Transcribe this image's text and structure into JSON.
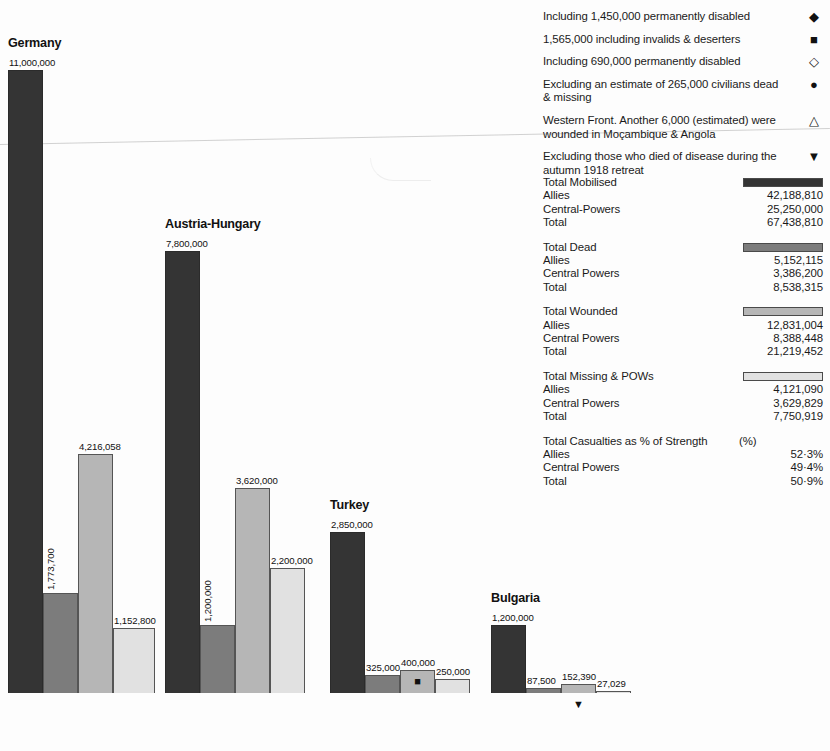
{
  "notes": [
    {
      "text": "Including 1,450,000 permanently disabled",
      "marker": "◆",
      "marker_name": "filled-diamond-icon"
    },
    {
      "text": "1,565,000 including invalids & deserters",
      "marker": "■",
      "marker_name": "filled-square-icon"
    },
    {
      "text": "Including 690,000 permanently disabled",
      "marker": "◇",
      "marker_name": "open-diamond-icon"
    },
    {
      "text": "Excluding an estimate of 265,000 civilians dead & missing",
      "marker": "●",
      "marker_name": "filled-circle-icon"
    },
    {
      "text": "Western Front. Another 6,000 (estimated) were wounded in Moçambique & Angola",
      "marker": "△",
      "marker_name": "open-triangle-icon"
    },
    {
      "text": "Excluding those who died of disease during the autumn 1918 retreat",
      "marker": "▼",
      "marker_name": "filled-down-triangle-icon"
    }
  ],
  "totals": [
    {
      "title": "Total Mobilised",
      "swatch": "#343434",
      "rows": [
        {
          "label": "Allies",
          "value": "42,188,810"
        },
        {
          "label": "Central-Powers",
          "value": "25,250,000"
        },
        {
          "label": "Total",
          "value": "67,438,810"
        }
      ]
    },
    {
      "title": "Total Dead",
      "swatch": "#7c7c7c",
      "rows": [
        {
          "label": "Allies",
          "value": "5,152,115"
        },
        {
          "label": "Central Powers",
          "value": "3,386,200"
        },
        {
          "label": "Total",
          "value": "8,538,315"
        }
      ]
    },
    {
      "title": "Total Wounded",
      "swatch": "#b6b6b6",
      "rows": [
        {
          "label": "Allies",
          "value": "12,831,004"
        },
        {
          "label": "Central Powers",
          "value": "8,388,448"
        },
        {
          "label": "Total",
          "value": "21,219,452"
        }
      ]
    },
    {
      "title": "Total Missing & POWs",
      "swatch": "#e1e1e1",
      "rows": [
        {
          "label": "Allies",
          "value": "4,121,090"
        },
        {
          "label": "Central Powers",
          "value": "3,629,829"
        },
        {
          "label": "Total",
          "value": "7,750,919"
        }
      ]
    },
    {
      "title": "Total Casualties as % of Strength",
      "swatch": null,
      "unit": "(%)",
      "rows": [
        {
          "label": "Allies",
          "value": "52·3%"
        },
        {
          "label": "Central Powers",
          "value": "49·4%"
        },
        {
          "label": "Total",
          "value": "50·9%"
        }
      ]
    }
  ],
  "chart_data": {
    "type": "bar",
    "title": "",
    "xlabel": "",
    "ylabel": "",
    "grid": false,
    "legend_position": "right",
    "series_names": [
      "Total Mobilised",
      "Total Dead",
      "Total Wounded",
      "Total Missing & POWs"
    ],
    "series_colors": [
      "#343434",
      "#7c7c7c",
      "#b6b6b6",
      "#e1e1e1"
    ],
    "ylim": [
      0,
      11000000
    ],
    "categories": [
      "Germany",
      "Austria-Hungary",
      "Turkey",
      "Bulgaria"
    ],
    "groups": [
      {
        "name": "Germany",
        "bars": [
          {
            "series": "Total Mobilised",
            "value": 11000000,
            "label": "11,000,000",
            "label_orientation": "horizontal",
            "marker": null
          },
          {
            "series": "Total Dead",
            "value": 1773700,
            "label": "1,773,700",
            "label_orientation": "vertical",
            "marker": null
          },
          {
            "series": "Total Wounded",
            "value": 4216058,
            "label": "4,216,058",
            "label_orientation": "horizontal",
            "marker": null
          },
          {
            "series": "Total Missing & POWs",
            "value": 1152800,
            "label": "1,152,800",
            "label_orientation": "horizontal",
            "marker": null
          }
        ]
      },
      {
        "name": "Austria-Hungary",
        "bars": [
          {
            "series": "Total Mobilised",
            "value": 7800000,
            "label": "7,800,000",
            "label_orientation": "horizontal",
            "marker": null
          },
          {
            "series": "Total Dead",
            "value": 1200000,
            "label": "1,200,000",
            "label_orientation": "vertical",
            "marker": null
          },
          {
            "series": "Total Wounded",
            "value": 3620000,
            "label": "3,620,000",
            "label_orientation": "horizontal",
            "marker": null
          },
          {
            "series": "Total Missing & POWs",
            "value": 2200000,
            "label": "2,200,000",
            "label_orientation": "horizontal",
            "marker": null
          }
        ]
      },
      {
        "name": "Turkey",
        "bars": [
          {
            "series": "Total Mobilised",
            "value": 2850000,
            "label": "2,850,000",
            "label_orientation": "horizontal",
            "marker": null
          },
          {
            "series": "Total Dead",
            "value": 325000,
            "label": "325,000",
            "label_orientation": "horizontal",
            "marker": null
          },
          {
            "series": "Total Wounded",
            "value": 400000,
            "label": "400,000",
            "label_orientation": "horizontal",
            "marker": "■",
            "marker_position": "inside"
          },
          {
            "series": "Total Missing & POWs",
            "value": 250000,
            "label": "250,000",
            "label_orientation": "horizontal",
            "marker": null
          }
        ]
      },
      {
        "name": "Bulgaria",
        "bars": [
          {
            "series": "Total Mobilised",
            "value": 1200000,
            "label": "1,200,000",
            "label_orientation": "horizontal",
            "marker": null
          },
          {
            "series": "Total Dead",
            "value": 87500,
            "label": "87,500",
            "label_orientation": "horizontal",
            "marker": null
          },
          {
            "series": "Total Wounded",
            "value": 152390,
            "label": "152,390",
            "label_orientation": "horizontal",
            "marker": "▼",
            "marker_position": "below"
          },
          {
            "series": "Total Missing & POWs",
            "value": 27029,
            "label": "27,029",
            "label_orientation": "horizontal",
            "marker": null
          }
        ]
      }
    ]
  }
}
